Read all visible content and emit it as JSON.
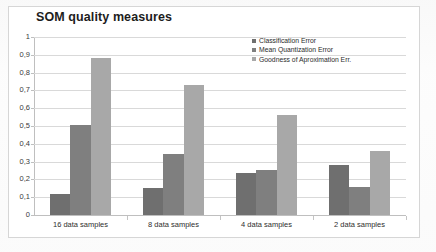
{
  "chart_data": {
    "type": "bar",
    "title": "SOM quality measures",
    "xlabel": "",
    "ylabel": "",
    "ylim": [
      0,
      1
    ],
    "ytick_labels": [
      "1",
      "0,9",
      "0,8",
      "0,7",
      "0,6",
      "0,5",
      "0,4",
      "0,3",
      "0,2",
      "0,1",
      "0"
    ],
    "ytick_values": [
      1,
      0.9,
      0.8,
      0.7,
      0.6,
      0.5,
      0.4,
      0.3,
      0.2,
      0.1,
      0
    ],
    "grid": "horizontal",
    "legend_position": "upper-right-inside",
    "categories": [
      "16 data samples",
      "8 data samples",
      "4 data samples",
      "2 data samples"
    ],
    "series": [
      {
        "name": "Classification Error",
        "color": "#6f6f6f",
        "values": [
          0.12,
          0.15,
          0.235,
          0.28
        ]
      },
      {
        "name": "Mean Quantization Error",
        "color": "#7f7f7f",
        "values": [
          0.505,
          0.34,
          0.255,
          0.16
        ]
      },
      {
        "name": "Goodness of Aproximation Err.",
        "color": "#a8a8a8",
        "values": [
          0.88,
          0.73,
          0.56,
          0.36
        ]
      }
    ]
  }
}
